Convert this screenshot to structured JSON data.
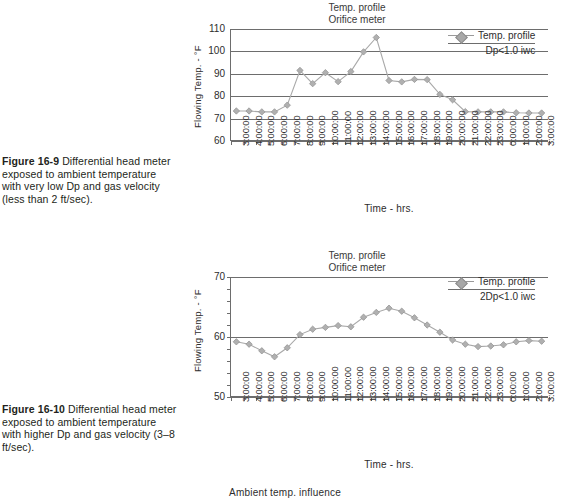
{
  "figures": [
    {
      "number": "Figure 16-9",
      "caption": "Differential head meter exposed to ambient temperature with very low Dp and gas velocity (less than 2 ft/sec)."
    },
    {
      "number": "Figure 16-10",
      "caption": "Differential head meter exposed to ambient temperature with higher Dp and gas velocity (3–8 ft/sec)."
    }
  ],
  "footer": {
    "note": "Ambient temp. influence"
  },
  "chart_data": [
    {
      "type": "line",
      "title": "Temp. profile",
      "subtitle": "Orifice meter",
      "xlabel": "Time - hrs.",
      "ylabel": "Flowing Temp. - °F",
      "ylim": [
        60,
        110
      ],
      "yticks": [
        60,
        70,
        80,
        90,
        100,
        110
      ],
      "grid": true,
      "legend_position": "top-right",
      "legend": {
        "series_label": "Temp. profile",
        "condition": "Dp<1.0 iwc"
      },
      "categories": [
        "3:00:00",
        "4:00:00",
        "5:00:00",
        "6:00:00",
        "7:00:00",
        "8:00:00",
        "9:00:00",
        "10:00:00",
        "11:00:00",
        "12:00:00",
        "13:00:00",
        "14:00:00",
        "15:00:00",
        "16:00:00",
        "17:00:00",
        "18:00:00",
        "19:00:00",
        "20:00:00",
        "21:00:00",
        "22:00:00",
        "23:00:00",
        "0:00:00",
        "1:00:00",
        "2:00:00",
        "3:00:00"
      ],
      "values": [
        73.4,
        73.4,
        73.0,
        73.0,
        76.0,
        91.5,
        85.6,
        90.5,
        86.5,
        91.0,
        99.8,
        106.2,
        87.0,
        86.4,
        87.5,
        87.4,
        80.8,
        78.4,
        73.1,
        73.0,
        73.0,
        73.0,
        72.6,
        72.5,
        72.5
      ]
    },
    {
      "type": "line",
      "title": "Temp. profile",
      "subtitle": "Orifice meter",
      "xlabel": "Time - hrs.",
      "ylabel": "Flowing Temp. - °F",
      "ylim": [
        50,
        70
      ],
      "yticks": [
        50,
        60,
        70
      ],
      "grid": true,
      "legend_position": "top-right",
      "legend": {
        "series_label": "Temp. profile",
        "condition": "2Dp<1.0 iwc"
      },
      "categories": [
        "3:00:00",
        "4:00:00",
        "5:00:00",
        "6:00:00",
        "7:00:00",
        "8:00:00",
        "9:00:00",
        "10:00:00",
        "11:00:00",
        "12:00:00",
        "13:00:00",
        "14:00:00",
        "15:00:00",
        "16:00:00",
        "17:00:00",
        "18:00:00",
        "19:00:00",
        "20:00:00",
        "21:00:00",
        "22:00:00",
        "23:00:00",
        "0:00:00",
        "1:00:00",
        "2:00:00",
        "3:00:00"
      ],
      "values": [
        59.2,
        58.8,
        57.7,
        56.7,
        58.2,
        60.4,
        61.3,
        61.6,
        61.9,
        61.7,
        63.3,
        64.1,
        64.8,
        64.3,
        63.2,
        62.0,
        60.8,
        59.5,
        58.8,
        58.4,
        58.5,
        58.7,
        59.2,
        59.4,
        59.3
      ]
    }
  ]
}
